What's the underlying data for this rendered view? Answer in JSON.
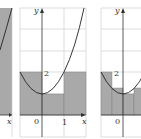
{
  "figure": {
    "colors": {
      "fill": "#a9a9a9",
      "grid": "#c8c8c8",
      "curve": "#222222",
      "axis": "#333333",
      "background": "#ffffff"
    },
    "panels": [
      {
        "id": "left-panel",
        "partial": true,
        "x_label": "x"
      },
      {
        "id": "middle-panel",
        "y_label": "y",
        "x_label": "x",
        "origin_label": "0",
        "x_tick_label": "1",
        "y_tick_label": "2",
        "rectangles": [
          {
            "x0": -1,
            "x1": 0,
            "height": 2
          },
          {
            "x0": 0,
            "x1": 1,
            "height": 1
          },
          {
            "x0": 1,
            "x1": 2,
            "height": 2
          }
        ]
      },
      {
        "id": "right-panel",
        "partial": true,
        "y_label": "y",
        "origin_label": "0",
        "y_tick_label": "2",
        "rectangles": [
          {
            "x0": -1,
            "x1": -0.5,
            "height": 2
          },
          {
            "x0": -0.5,
            "x1": 0,
            "height": 1.25
          },
          {
            "x0": 0,
            "x1": 0.5,
            "height": 1
          },
          {
            "x0": 0.5,
            "x1": 1,
            "height": 1.25
          }
        ]
      }
    ]
  }
}
